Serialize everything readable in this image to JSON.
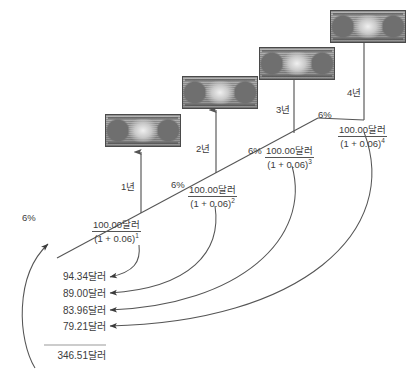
{
  "diagram": {
    "currency_suffix": "달러",
    "line_color": "#555555",
    "text_color": "#3b3b3b",
    "background": "#ffffff"
  },
  "periods": [
    {
      "year_label": "1년",
      "rate_label": "6%",
      "numerator": "100.00달러",
      "denominator": "(1 + 0.06)",
      "exponent": "1",
      "present_value": "94.34달러"
    },
    {
      "year_label": "2년",
      "rate_label": "6%",
      "numerator": "100.00달러",
      "denominator": "(1 + 0.06)",
      "exponent": "2",
      "present_value": "89.00달러"
    },
    {
      "year_label": "3년",
      "rate_label": "6%",
      "numerator": "100.00달러",
      "denominator": "(1 + 0.06)",
      "exponent": "3",
      "present_value": "83.96달러"
    },
    {
      "year_label": "4년",
      "rate_label": "6%",
      "numerator": "100.00달러",
      "denominator": "(1 + 0.06)",
      "exponent": "4",
      "present_value": "79.21달러"
    }
  ],
  "leading_rate_label": "6%",
  "total": {
    "value": "346.51달러"
  },
  "bills": [
    {
      "denomination": "100",
      "alt": "one-hundred-dollar-bill"
    },
    {
      "denomination": "100",
      "alt": "one-hundred-dollar-bill"
    },
    {
      "denomination": "100",
      "alt": "one-hundred-dollar-bill"
    },
    {
      "denomination": "100",
      "alt": "one-hundred-dollar-bill"
    }
  ]
}
